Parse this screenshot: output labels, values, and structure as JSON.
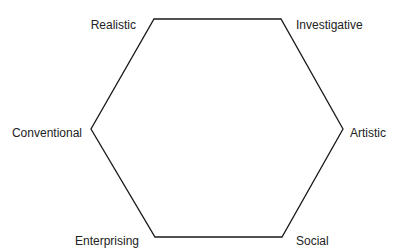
{
  "diagram": {
    "type": "hexagon",
    "stroke_color": "#1a1a1a",
    "label_color": "#222222",
    "background": "#ffffff",
    "vertices": [
      {
        "id": "realistic",
        "label": "Realistic",
        "x": 154,
        "y": 19
      },
      {
        "id": "investigative",
        "label": "Investigative",
        "x": 281,
        "y": 19
      },
      {
        "id": "artistic",
        "label": "Artistic",
        "x": 343,
        "y": 129
      },
      {
        "id": "social",
        "label": "Social",
        "x": 282,
        "y": 237
      },
      {
        "id": "enterprising",
        "label": "Enterprising",
        "x": 155,
        "y": 237
      },
      {
        "id": "conventional",
        "label": "Conventional",
        "x": 91,
        "y": 129
      }
    ]
  }
}
